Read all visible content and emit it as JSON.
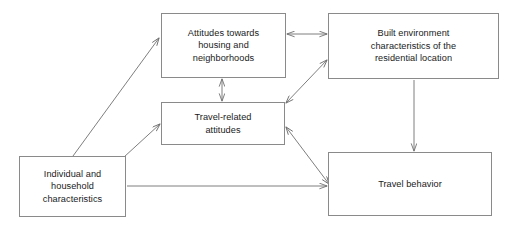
{
  "diagram": {
    "background_color": "#ffffff",
    "line_color": "#8a8a8a",
    "text_color": "#1a1a1a",
    "nodes": [
      {
        "id": "attitudes-housing",
        "label": "Attitudes towards\nhousing and\nneighborhoods",
        "x": 161,
        "y": 13,
        "w": 125,
        "h": 65
      },
      {
        "id": "built-environment",
        "label": "Built environment\ncharacteristics of the\nresidential location",
        "x": 328,
        "y": 13,
        "w": 171,
        "h": 66
      },
      {
        "id": "travel-attitudes",
        "label": "Travel-related\nattitudes",
        "x": 161,
        "y": 102,
        "w": 124,
        "h": 43
      },
      {
        "id": "individual-household",
        "label": "Individual and\nhousehold\ncharacteristics",
        "x": 19,
        "y": 156,
        "w": 107,
        "h": 61
      },
      {
        "id": "travel-behavior",
        "label": "Travel behavior",
        "x": 328,
        "y": 152,
        "w": 164,
        "h": 64
      }
    ],
    "edges": [
      {
        "id": "attitudes-housing--built-environment",
        "from": "attitudes-housing",
        "to": "built-environment",
        "direction": "both",
        "shape": "horizontal"
      },
      {
        "id": "attitudes-housing--travel-attitudes",
        "from": "attitudes-housing",
        "to": "travel-attitudes",
        "direction": "both",
        "shape": "vertical"
      },
      {
        "id": "travel-attitudes--built-environment",
        "from": "travel-attitudes",
        "to": "built-environment",
        "direction": "both",
        "shape": "diagonal"
      },
      {
        "id": "travel-attitudes--travel-behavior",
        "from": "travel-attitudes",
        "to": "travel-behavior",
        "direction": "both",
        "shape": "diagonal"
      },
      {
        "id": "built-environment--travel-behavior",
        "from": "built-environment",
        "to": "travel-behavior",
        "direction": "forward",
        "shape": "vertical"
      },
      {
        "id": "individual-household--attitudes-housing",
        "from": "individual-household",
        "to": "attitudes-housing",
        "direction": "forward",
        "shape": "diagonal"
      },
      {
        "id": "individual-household--travel-attitudes",
        "from": "individual-household",
        "to": "travel-attitudes",
        "direction": "forward",
        "shape": "diagonal"
      },
      {
        "id": "individual-household--travel-behavior",
        "from": "individual-household",
        "to": "travel-behavior",
        "direction": "forward",
        "shape": "horizontal"
      }
    ]
  }
}
